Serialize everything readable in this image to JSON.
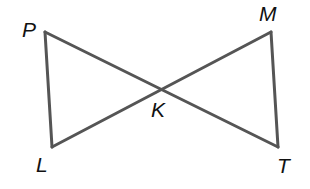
{
  "diagram": {
    "type": "geometry-figure",
    "stroke_color": "#555555",
    "label_color": "#111111",
    "points": {
      "P": {
        "label": "P",
        "x": 45,
        "y": 32
      },
      "M": {
        "label": "M",
        "x": 271,
        "y": 32
      },
      "L": {
        "label": "L",
        "x": 52,
        "y": 147
      },
      "T": {
        "label": "T",
        "x": 278,
        "y": 147
      },
      "K": {
        "label": "K",
        "x": 161,
        "y": 89
      }
    },
    "segments": [
      {
        "from": "P",
        "to": "T"
      },
      {
        "from": "M",
        "to": "L"
      },
      {
        "from": "P",
        "to": "L"
      },
      {
        "from": "M",
        "to": "T"
      }
    ]
  }
}
